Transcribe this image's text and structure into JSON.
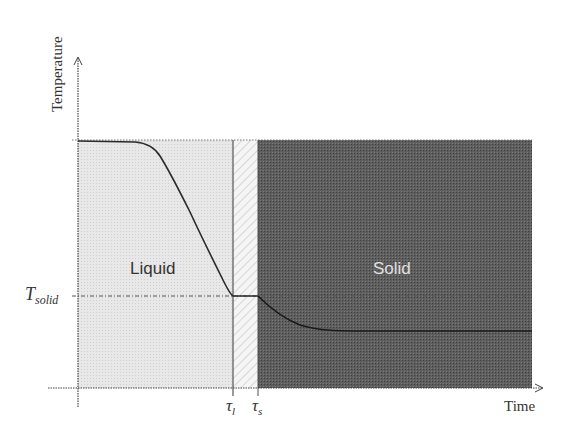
{
  "diagram": {
    "axes": {
      "y_label": "Temperature",
      "x_label": "Time"
    },
    "regions": [
      {
        "name": "liquid",
        "label": "Liquid",
        "fill": "#e6e6e6",
        "text_color": "#333333"
      },
      {
        "name": "mushy",
        "label": "",
        "fill": "#f4f4f4",
        "pattern": "diagonal-hatch"
      },
      {
        "name": "solid",
        "label": "Solid",
        "fill": "#5c5c5c",
        "text_color": "#e0e0e0"
      }
    ],
    "markers": {
      "t_solid_main": "T",
      "t_solid_sub": "solid",
      "tau_l_main": "τ",
      "tau_l_sub": "l",
      "tau_s_main": "τ",
      "tau_s_sub": "s"
    },
    "colors": {
      "axis": "#444444",
      "curve": "#222222",
      "dashed": "#555555"
    }
  }
}
